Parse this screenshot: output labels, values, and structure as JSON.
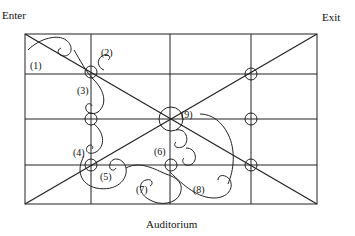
{
  "labels": {
    "enter": "Enter",
    "exit": "Exit",
    "auditorium": "Auditorium"
  },
  "grid": {
    "left": 25,
    "right": 317,
    "top": 34,
    "bottom": 204,
    "vertical_lines_x": [
      91,
      170,
      251
    ],
    "horizontal_lines_y": [
      74,
      119,
      165
    ]
  },
  "markers": [
    {
      "id": "1",
      "label": "(1)"
    },
    {
      "id": "2",
      "label": "(2)"
    },
    {
      "id": "3",
      "label": "(3)"
    },
    {
      "id": "4",
      "label": "(4)"
    },
    {
      "id": "5",
      "label": "(5)"
    },
    {
      "id": "6",
      "label": "(6)"
    },
    {
      "id": "7",
      "label": "(7)"
    },
    {
      "id": "8",
      "label": "(8)"
    },
    {
      "id": "9",
      "label": "(9)"
    }
  ],
  "colors": {
    "line": "#222222",
    "background": "#ffffff"
  }
}
